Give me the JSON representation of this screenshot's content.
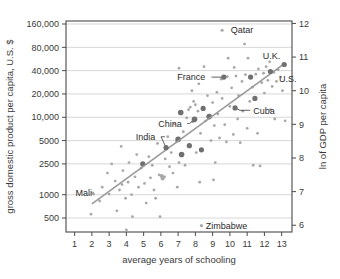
{
  "chart_data": {
    "type": "scatter",
    "title": "",
    "xlabel": "average years of schooling",
    "ylabel": "gross domestic product per capita, U.S. $",
    "y2label": "ln of GDP per capita",
    "xlim": [
      0.5,
      13.6
    ],
    "ylim_log": [
      330,
      175000
    ],
    "xticks": [
      1,
      2,
      3,
      4,
      5,
      6,
      7,
      8,
      9,
      10,
      11,
      12,
      13
    ],
    "xtick_labels": [
      "1",
      "2",
      "3",
      "4",
      "5",
      "6",
      "7",
      "8",
      "9",
      "10",
      "11",
      "12",
      "13"
    ],
    "yticks": [
      160000,
      80000,
      40000,
      20000,
      10000,
      5000,
      2500,
      1000,
      500
    ],
    "ytick_labels": [
      "160,000",
      "80,000",
      "40,000",
      "20,000",
      "10,000",
      "5000",
      "2500",
      "1000",
      "500"
    ],
    "y2ticks": [
      12,
      11,
      10,
      9,
      8,
      7,
      6
    ],
    "y2tick_labels": [
      "12",
      "11",
      "10",
      "9",
      "8",
      "7",
      "6"
    ],
    "grid": "horizontal",
    "legend": "none",
    "scale": "log-y",
    "trendline": {
      "x0": 2.0,
      "y0": 760,
      "x1": 13.2,
      "y1": 50000
    },
    "point_color": "#a8a8a8",
    "highlight_color": "#707070",
    "labeled_points": [
      {
        "label": "Qatar",
        "x": 9.55,
        "y": 133000,
        "lx": 10.05,
        "ly": 133000,
        "anchor": "start",
        "leader": false,
        "size": 1.6
      },
      {
        "label": "U.K.",
        "x": 12.35,
        "y": 39000,
        "lx": 11.9,
        "ly": 62000,
        "anchor": "start",
        "leader": false,
        "size": 2.6
      },
      {
        "label": "U.S.",
        "x": 13.15,
        "y": 48000,
        "lx": 12.85,
        "ly": 31500,
        "anchor": "start",
        "leader": false,
        "size": 2.6
      },
      {
        "label": "France",
        "x": 9.65,
        "y": 33000,
        "lx": 6.95,
        "ly": 33000,
        "anchor": "start",
        "leader": true,
        "size": 2.6
      },
      {
        "label": "Cuba",
        "x": 10.3,
        "y": 13200,
        "lx": 11.35,
        "ly": 12300,
        "anchor": "start",
        "leader": true,
        "size": 2.6
      },
      {
        "label": "China",
        "x": 7.95,
        "y": 9400,
        "lx": 5.85,
        "ly": 8300,
        "anchor": "start",
        "leader": true,
        "size": 2.8
      },
      {
        "label": "India",
        "x": 6.3,
        "y": 4050,
        "lx": 4.55,
        "ly": 5600,
        "anchor": "start",
        "leader": true,
        "size": 2.6
      },
      {
        "label": "Mali",
        "x": 2.05,
        "y": 1050,
        "lx": 1.05,
        "ly": 1050,
        "anchor": "start",
        "leader": false,
        "size": 1.6
      },
      {
        "label": "Zimbabwe",
        "x": 8.35,
        "y": 400,
        "lx": 8.6,
        "ly": 400,
        "anchor": "start",
        "leader": false,
        "size": 1.6
      }
    ],
    "points": [
      {
        "x": 1.95,
        "y": 560,
        "s": 1.4
      },
      {
        "x": 2.1,
        "y": 1020,
        "s": 1.4
      },
      {
        "x": 2.45,
        "y": 830,
        "s": 1.4
      },
      {
        "x": 2.6,
        "y": 1250,
        "s": 1.4
      },
      {
        "x": 2.9,
        "y": 1900,
        "s": 1.4
      },
      {
        "x": 3.0,
        "y": 1020,
        "s": 1.4
      },
      {
        "x": 3.15,
        "y": 2500,
        "s": 1.4
      },
      {
        "x": 3.35,
        "y": 1500,
        "s": 1.4
      },
      {
        "x": 3.45,
        "y": 620,
        "s": 1.4
      },
      {
        "x": 3.6,
        "y": 1150,
        "s": 1.4
      },
      {
        "x": 3.7,
        "y": 4200,
        "s": 1.4
      },
      {
        "x": 3.75,
        "y": 1350,
        "s": 1.4
      },
      {
        "x": 3.8,
        "y": 2050,
        "s": 1.4
      },
      {
        "x": 3.95,
        "y": 900,
        "s": 1.4
      },
      {
        "x": 4.0,
        "y": 350,
        "s": 1.4
      },
      {
        "x": 4.1,
        "y": 1450,
        "s": 1.4
      },
      {
        "x": 4.15,
        "y": 2600,
        "s": 1.4
      },
      {
        "x": 4.3,
        "y": 1000,
        "s": 1.4
      },
      {
        "x": 4.35,
        "y": 520,
        "s": 1.4
      },
      {
        "x": 4.5,
        "y": 1700,
        "s": 1.4
      },
      {
        "x": 4.6,
        "y": 3300,
        "s": 1.4
      },
      {
        "x": 4.7,
        "y": 1250,
        "s": 1.4
      },
      {
        "x": 4.85,
        "y": 2200,
        "s": 1.4
      },
      {
        "x": 4.95,
        "y": 2500,
        "s": 2.6
      },
      {
        "x": 5.05,
        "y": 1400,
        "s": 1.4
      },
      {
        "x": 5.15,
        "y": 780,
        "s": 1.4
      },
      {
        "x": 5.3,
        "y": 3100,
        "s": 1.4
      },
      {
        "x": 5.4,
        "y": 1650,
        "s": 1.4
      },
      {
        "x": 5.5,
        "y": 2400,
        "s": 1.4
      },
      {
        "x": 5.6,
        "y": 1150,
        "s": 1.4
      },
      {
        "x": 5.7,
        "y": 900,
        "s": 1.4
      },
      {
        "x": 5.8,
        "y": 4600,
        "s": 1.4
      },
      {
        "x": 5.9,
        "y": 1800,
        "s": 1.4
      },
      {
        "x": 5.95,
        "y": 520,
        "s": 1.4
      },
      {
        "x": 6.05,
        "y": 1750,
        "s": 2.0
      },
      {
        "x": 6.1,
        "y": 1620,
        "s": 2.0
      },
      {
        "x": 6.2,
        "y": 1700,
        "s": 1.6
      },
      {
        "x": 6.25,
        "y": 2900,
        "s": 1.4
      },
      {
        "x": 6.4,
        "y": 5600,
        "s": 1.4
      },
      {
        "x": 6.5,
        "y": 2300,
        "s": 1.4
      },
      {
        "x": 6.6,
        "y": 3500,
        "s": 1.4
      },
      {
        "x": 6.7,
        "y": 1900,
        "s": 1.4
      },
      {
        "x": 6.8,
        "y": 8200,
        "s": 1.4
      },
      {
        "x": 6.9,
        "y": 4800,
        "s": 1.4
      },
      {
        "x": 7.0,
        "y": 5200,
        "s": 2.8
      },
      {
        "x": 7.05,
        "y": 2600,
        "s": 1.4
      },
      {
        "x": 7.15,
        "y": 11500,
        "s": 2.8
      },
      {
        "x": 7.2,
        "y": 3300,
        "s": 2.8
      },
      {
        "x": 7.3,
        "y": 6500,
        "s": 1.4
      },
      {
        "x": 7.4,
        "y": 2400,
        "s": 1.4
      },
      {
        "x": 7.5,
        "y": 9800,
        "s": 1.4
      },
      {
        "x": 7.6,
        "y": 12500,
        "s": 1.4
      },
      {
        "x": 7.65,
        "y": 4300,
        "s": 2.6
      },
      {
        "x": 7.7,
        "y": 13500,
        "s": 1.4
      },
      {
        "x": 7.8,
        "y": 22000,
        "s": 1.4
      },
      {
        "x": 7.85,
        "y": 8800,
        "s": 1.6
      },
      {
        "x": 7.9,
        "y": 16000,
        "s": 1.4
      },
      {
        "x": 8.0,
        "y": 14500,
        "s": 1.4
      },
      {
        "x": 8.05,
        "y": 3500,
        "s": 1.4
      },
      {
        "x": 8.15,
        "y": 12000,
        "s": 1.4
      },
      {
        "x": 8.2,
        "y": 27000,
        "s": 1.4
      },
      {
        "x": 8.3,
        "y": 6200,
        "s": 1.4
      },
      {
        "x": 8.35,
        "y": 3800,
        "s": 2.6
      },
      {
        "x": 8.45,
        "y": 13000,
        "s": 2.6
      },
      {
        "x": 8.5,
        "y": 45000,
        "s": 1.4
      },
      {
        "x": 8.6,
        "y": 9000,
        "s": 1.4
      },
      {
        "x": 8.7,
        "y": 19000,
        "s": 1.4
      },
      {
        "x": 8.8,
        "y": 10200,
        "s": 2.8
      },
      {
        "x": 8.9,
        "y": 5000,
        "s": 1.4
      },
      {
        "x": 9.0,
        "y": 15500,
        "s": 1.4
      },
      {
        "x": 9.1,
        "y": 7800,
        "s": 1.4
      },
      {
        "x": 9.15,
        "y": 2600,
        "s": 1.4
      },
      {
        "x": 9.25,
        "y": 21000,
        "s": 1.4
      },
      {
        "x": 9.3,
        "y": 11000,
        "s": 1.4
      },
      {
        "x": 9.4,
        "y": 5400,
        "s": 1.4
      },
      {
        "x": 9.5,
        "y": 31000,
        "s": 1.4
      },
      {
        "x": 9.55,
        "y": 17500,
        "s": 1.4
      },
      {
        "x": 9.7,
        "y": 8000,
        "s": 1.4
      },
      {
        "x": 9.8,
        "y": 4800,
        "s": 1.4
      },
      {
        "x": 9.85,
        "y": 33500,
        "s": 1.4
      },
      {
        "x": 9.9,
        "y": 58000,
        "s": 1.4
      },
      {
        "x": 10.0,
        "y": 13800,
        "s": 1.4
      },
      {
        "x": 10.1,
        "y": 24000,
        "s": 1.4
      },
      {
        "x": 10.2,
        "y": 6000,
        "s": 1.4
      },
      {
        "x": 10.35,
        "y": 34000,
        "s": 1.4
      },
      {
        "x": 10.45,
        "y": 9500,
        "s": 1.4
      },
      {
        "x": 10.5,
        "y": 19000,
        "s": 1.4
      },
      {
        "x": 10.6,
        "y": 4700,
        "s": 1.4
      },
      {
        "x": 10.7,
        "y": 29000,
        "s": 1.4
      },
      {
        "x": 10.75,
        "y": 12000,
        "s": 1.4
      },
      {
        "x": 10.85,
        "y": 88000,
        "s": 1.4
      },
      {
        "x": 10.9,
        "y": 35500,
        "s": 1.4
      },
      {
        "x": 11.0,
        "y": 7200,
        "s": 1.4
      },
      {
        "x": 11.05,
        "y": 58000,
        "s": 1.4
      },
      {
        "x": 11.15,
        "y": 16000,
        "s": 1.4
      },
      {
        "x": 11.2,
        "y": 33000,
        "s": 2.6
      },
      {
        "x": 11.3,
        "y": 24500,
        "s": 1.4
      },
      {
        "x": 11.35,
        "y": 2400,
        "s": 1.4
      },
      {
        "x": 11.45,
        "y": 17500,
        "s": 2.6
      },
      {
        "x": 11.5,
        "y": 36000,
        "s": 1.4
      },
      {
        "x": 11.6,
        "y": 6200,
        "s": 1.4
      },
      {
        "x": 11.65,
        "y": 42000,
        "s": 1.4
      },
      {
        "x": 11.75,
        "y": 2350,
        "s": 1.4
      },
      {
        "x": 11.85,
        "y": 28000,
        "s": 1.4
      },
      {
        "x": 11.95,
        "y": 37000,
        "s": 1.4
      },
      {
        "x": 12.0,
        "y": 20500,
        "s": 1.4
      },
      {
        "x": 12.1,
        "y": 45000,
        "s": 1.4
      },
      {
        "x": 12.2,
        "y": 30000,
        "s": 1.4
      },
      {
        "x": 12.3,
        "y": 52000,
        "s": 1.4
      },
      {
        "x": 12.45,
        "y": 25000,
        "s": 1.4
      },
      {
        "x": 12.55,
        "y": 38000,
        "s": 1.4
      },
      {
        "x": 12.7,
        "y": 29000,
        "s": 1.4
      },
      {
        "x": 12.8,
        "y": 41000,
        "s": 1.4
      },
      {
        "x": 12.95,
        "y": 33000,
        "s": 1.4
      },
      {
        "x": 13.05,
        "y": 22000,
        "s": 1.4
      },
      {
        "x": 13.2,
        "y": 9000,
        "s": 1.4
      },
      {
        "x": 12.6,
        "y": 9500,
        "s": 1.4
      },
      {
        "x": 12.35,
        "y": 12500,
        "s": 1.4
      },
      {
        "x": 10.25,
        "y": 44000,
        "s": 1.4
      },
      {
        "x": 7.05,
        "y": 43000,
        "s": 1.4
      },
      {
        "x": 6.95,
        "y": 1250,
        "s": 1.4
      },
      {
        "x": 8.25,
        "y": 1450,
        "s": 1.4
      },
      {
        "x": 9.05,
        "y": 1550,
        "s": 1.4
      }
    ]
  }
}
